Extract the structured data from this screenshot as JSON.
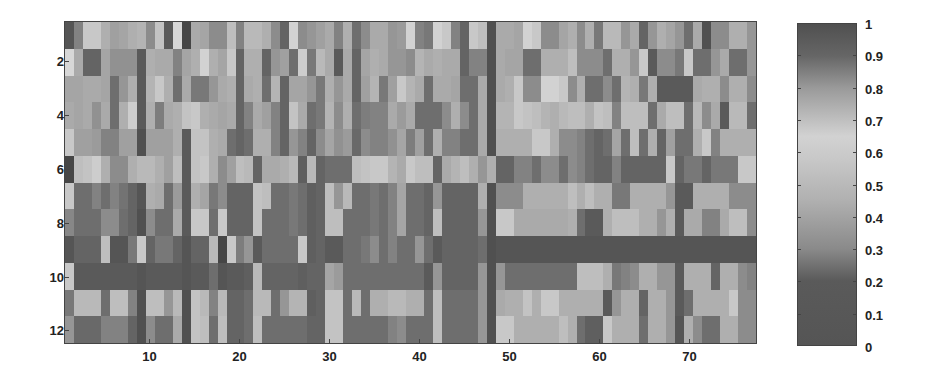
{
  "chart_data": {
    "type": "heatmap",
    "title": "",
    "xlabel": "",
    "ylabel": "",
    "n_rows": 12,
    "n_cols": 77,
    "x_ticks": [
      10,
      20,
      30,
      40,
      50,
      60,
      70
    ],
    "y_ticks": [
      2,
      4,
      6,
      8,
      10,
      12
    ],
    "colorbar": {
      "ticks": [
        "0",
        "0.1",
        "0.2",
        "0.3",
        "0.4",
        "0.5",
        "0.6",
        "0.7",
        "0.8",
        "0.9",
        "1"
      ],
      "range": [
        0,
        1
      ],
      "colormap": "grayscale (dark at 0, lightest near 0.6-0.65, dark at 1)"
    },
    "cell_gray_levels_note": "approximate rendered grey level (0-255) per cell, row-major, rows 1-12 top to bottom, cols 1-77 left to right",
    "grid": [
      [
        85,
        130,
        200,
        200,
        175,
        160,
        165,
        175,
        180,
        140,
        195,
        90,
        215,
        70,
        170,
        165,
        140,
        140,
        190,
        130,
        185,
        185,
        175,
        140,
        100,
        210,
        140,
        150,
        160,
        170,
        130,
        175,
        110,
        140,
        170,
        170,
        150,
        155,
        210,
        130,
        120,
        210,
        200,
        130,
        100,
        200,
        190,
        80,
        170,
        170,
        165,
        210,
        200,
        140,
        140,
        165,
        175,
        140,
        175,
        120,
        185,
        185,
        150,
        170,
        100,
        150,
        175,
        165,
        150,
        110,
        170,
        80,
        140,
        140,
        175,
        175,
        150
      ],
      [
        215,
        170,
        100,
        100,
        165,
        145,
        145,
        145,
        90,
        175,
        170,
        170,
        130,
        165,
        175,
        210,
        175,
        165,
        200,
        100,
        175,
        175,
        100,
        150,
        160,
        110,
        205,
        120,
        185,
        170,
        90,
        170,
        100,
        165,
        175,
        170,
        150,
        150,
        140,
        180,
        170,
        175,
        170,
        170,
        100,
        130,
        130,
        80,
        170,
        165,
        165,
        110,
        110,
        175,
        175,
        175,
        190,
        140,
        140,
        140,
        110,
        175,
        175,
        150,
        200,
        90,
        140,
        140,
        120,
        200,
        110,
        110,
        150,
        170,
        110,
        110,
        150
      ],
      [
        165,
        165,
        170,
        170,
        165,
        110,
        150,
        175,
        90,
        180,
        200,
        175,
        110,
        170,
        120,
        120,
        150,
        170,
        175,
        100,
        170,
        175,
        110,
        180,
        100,
        165,
        165,
        150,
        120,
        175,
        150,
        170,
        100,
        160,
        180,
        120,
        160,
        200,
        180,
        170,
        110,
        170,
        170,
        165,
        110,
        110,
        170,
        80,
        170,
        175,
        200,
        140,
        140,
        210,
        210,
        200,
        140,
        175,
        110,
        110,
        140,
        110,
        180,
        175,
        120,
        175,
        90,
        90,
        90,
        90,
        170,
        175,
        175,
        140,
        175,
        175,
        140
      ],
      [
        170,
        165,
        170,
        145,
        170,
        110,
        175,
        205,
        90,
        175,
        125,
        170,
        175,
        195,
        200,
        175,
        170,
        165,
        170,
        100,
        130,
        170,
        160,
        130,
        100,
        195,
        170,
        110,
        120,
        180,
        140,
        175,
        110,
        125,
        130,
        130,
        170,
        155,
        170,
        110,
        110,
        110,
        140,
        175,
        140,
        110,
        170,
        80,
        180,
        180,
        200,
        195,
        190,
        180,
        175,
        185,
        190,
        190,
        175,
        195,
        190,
        130,
        190,
        190,
        190,
        110,
        170,
        190,
        190,
        110,
        185,
        140,
        170,
        90,
        185,
        185,
        110
      ],
      [
        200,
        160,
        160,
        155,
        130,
        130,
        160,
        160,
        80,
        160,
        160,
        160,
        175,
        90,
        195,
        195,
        175,
        170,
        110,
        100,
        110,
        175,
        175,
        130,
        100,
        150,
        130,
        100,
        140,
        165,
        145,
        155,
        105,
        140,
        130,
        130,
        145,
        165,
        125,
        160,
        110,
        175,
        130,
        130,
        110,
        110,
        170,
        80,
        175,
        175,
        175,
        175,
        200,
        200,
        175,
        140,
        140,
        130,
        110,
        100,
        110,
        165,
        110,
        190,
        110,
        175,
        100,
        160,
        110,
        110,
        175,
        200,
        130,
        175,
        175,
        175,
        175
      ],
      [
        70,
        190,
        195,
        205,
        175,
        140,
        140,
        175,
        185,
        185,
        175,
        160,
        190,
        90,
        195,
        200,
        175,
        140,
        160,
        190,
        185,
        100,
        170,
        170,
        175,
        185,
        95,
        185,
        100,
        110,
        110,
        110,
        190,
        195,
        200,
        200,
        180,
        170,
        200,
        190,
        190,
        100,
        170,
        180,
        190,
        175,
        150,
        175,
        100,
        100,
        130,
        130,
        110,
        140,
        140,
        110,
        140,
        130,
        110,
        100,
        100,
        130,
        100,
        100,
        100,
        100,
        100,
        200,
        100,
        120,
        120,
        100,
        120,
        120,
        120,
        200,
        200
      ],
      [
        200,
        110,
        110,
        130,
        110,
        130,
        115,
        100,
        85,
        175,
        170,
        110,
        155,
        90,
        175,
        165,
        120,
        140,
        100,
        100,
        100,
        195,
        190,
        110,
        110,
        120,
        110,
        95,
        100,
        190,
        150,
        185,
        110,
        110,
        120,
        110,
        130,
        165,
        110,
        110,
        100,
        150,
        100,
        100,
        100,
        100,
        175,
        80,
        140,
        140,
        140,
        175,
        175,
        175,
        175,
        175,
        190,
        175,
        190,
        175,
        175,
        120,
        120,
        175,
        175,
        175,
        175,
        150,
        90,
        90,
        175,
        175,
        175,
        175,
        140,
        140,
        140
      ],
      [
        135,
        110,
        110,
        110,
        140,
        140,
        110,
        100,
        80,
        140,
        110,
        110,
        170,
        90,
        200,
        200,
        110,
        200,
        100,
        100,
        100,
        195,
        110,
        110,
        110,
        120,
        110,
        95,
        100,
        190,
        190,
        110,
        110,
        110,
        120,
        110,
        130,
        165,
        110,
        110,
        100,
        190,
        100,
        100,
        100,
        100,
        150,
        80,
        200,
        200,
        170,
        170,
        170,
        170,
        170,
        170,
        175,
        110,
        90,
        90,
        175,
        190,
        190,
        190,
        175,
        175,
        150,
        175,
        90,
        170,
        170,
        130,
        130,
        170,
        190,
        190,
        140
      ],
      [
        85,
        100,
        100,
        100,
        190,
        85,
        85,
        120,
        200,
        100,
        120,
        120,
        100,
        85,
        100,
        100,
        185,
        70,
        200,
        125,
        150,
        90,
        110,
        110,
        110,
        110,
        200,
        95,
        100,
        90,
        90,
        110,
        110,
        120,
        140,
        110,
        130,
        110,
        110,
        150,
        110,
        90,
        100,
        100,
        100,
        100,
        110,
        80,
        85,
        85,
        85,
        85,
        85,
        85,
        85,
        85,
        85,
        85,
        85,
        85,
        85,
        85,
        85,
        85,
        85,
        85,
        85,
        85,
        85,
        85,
        85,
        85,
        85,
        85,
        85,
        85,
        85
      ],
      [
        200,
        90,
        90,
        90,
        90,
        90,
        90,
        90,
        85,
        90,
        90,
        90,
        90,
        85,
        90,
        90,
        110,
        85,
        90,
        90,
        95,
        185,
        100,
        100,
        100,
        100,
        95,
        100,
        100,
        165,
        155,
        110,
        110,
        110,
        110,
        110,
        110,
        110,
        110,
        110,
        90,
        150,
        100,
        100,
        100,
        100,
        150,
        80,
        150,
        110,
        110,
        110,
        110,
        110,
        110,
        110,
        110,
        190,
        190,
        190,
        175,
        120,
        130,
        140,
        175,
        175,
        150,
        150,
        90,
        175,
        175,
        175,
        100,
        175,
        175,
        140,
        130
      ],
      [
        120,
        185,
        185,
        185,
        110,
        190,
        190,
        130,
        80,
        190,
        190,
        150,
        185,
        80,
        195,
        185,
        130,
        185,
        100,
        100,
        110,
        185,
        185,
        110,
        150,
        180,
        180,
        95,
        100,
        195,
        195,
        110,
        185,
        110,
        175,
        175,
        185,
        185,
        175,
        175,
        110,
        190,
        110,
        110,
        110,
        110,
        150,
        80,
        170,
        175,
        175,
        195,
        175,
        200,
        200,
        175,
        175,
        175,
        175,
        175,
        90,
        150,
        175,
        175,
        100,
        175,
        175,
        150,
        90,
        110,
        175,
        175,
        175,
        175,
        200,
        140,
        140
      ],
      [
        150,
        105,
        105,
        105,
        130,
        130,
        130,
        100,
        80,
        140,
        110,
        110,
        170,
        80,
        195,
        190,
        110,
        190,
        100,
        100,
        110,
        190,
        110,
        110,
        110,
        110,
        110,
        100,
        100,
        195,
        195,
        110,
        110,
        110,
        110,
        110,
        130,
        140,
        110,
        110,
        110,
        190,
        110,
        110,
        110,
        110,
        150,
        80,
        200,
        200,
        175,
        175,
        175,
        175,
        175,
        190,
        175,
        110,
        95,
        95,
        200,
        175,
        175,
        175,
        110,
        175,
        175,
        150,
        85,
        175,
        140,
        110,
        110,
        175,
        175,
        140,
        140
      ]
    ]
  },
  "axes": {
    "y_tick_labels": [
      "2",
      "4",
      "6",
      "8",
      "10",
      "12"
    ],
    "x_tick_labels": [
      "10",
      "20",
      "30",
      "40",
      "50",
      "60",
      "70"
    ]
  },
  "colorbar": {
    "labels": [
      "1",
      "0.9",
      "0.8",
      "0.7",
      "0.6",
      "0.5",
      "0.4",
      "0.3",
      "0.2",
      "0.1",
      "0"
    ]
  }
}
